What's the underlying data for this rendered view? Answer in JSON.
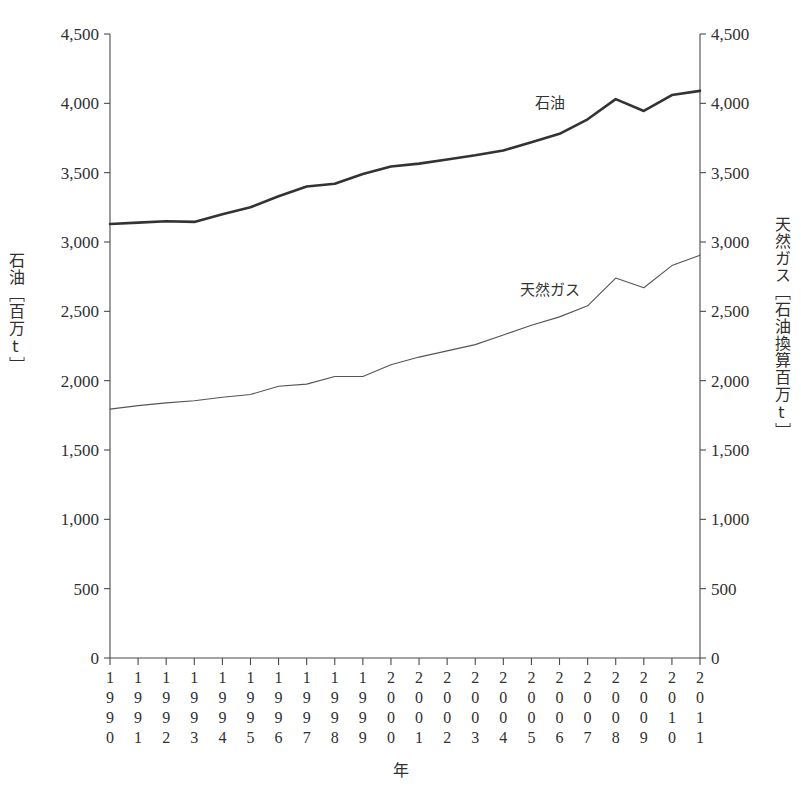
{
  "chart_data": {
    "type": "line",
    "title": "",
    "xlabel": "年",
    "ylabel_left": "石油［百万t］",
    "ylabel_right": "天然ガス［石油換算百万t］",
    "categories": [
      "1990",
      "1991",
      "1992",
      "1993",
      "1994",
      "1995",
      "1996",
      "1997",
      "1998",
      "1999",
      "2000",
      "2001",
      "2002",
      "2003",
      "2004",
      "2005",
      "2006",
      "2007",
      "2008",
      "2009",
      "2010",
      "2011"
    ],
    "ylim_left": [
      0,
      4500
    ],
    "ylim_right": [
      0,
      4500
    ],
    "yticks_left": [
      "0",
      "500",
      "1,000",
      "1,500",
      "2,000",
      "2,500",
      "3,000",
      "3,500",
      "4,000",
      "4,500"
    ],
    "yticks_right": [
      "0",
      "500",
      "1,000",
      "1,500",
      "2,000",
      "2,500",
      "3,000",
      "3,500",
      "4,000",
      "4,500"
    ],
    "ytick_values": [
      0,
      500,
      1000,
      1500,
      2000,
      2500,
      3000,
      3500,
      4000,
      4500
    ],
    "grid": false,
    "legend_position": "inline-annotation",
    "series": [
      {
        "name": "石油",
        "unit": "百万t",
        "label_x_year": "2006",
        "values": [
          3130,
          3140,
          3150,
          3145,
          3200,
          3250,
          3330,
          3400,
          3420,
          3490,
          3545,
          3565,
          3595,
          3625,
          3660,
          3720,
          3780,
          3885,
          4030,
          3945,
          4060,
          4090
        ]
      },
      {
        "name": "天然ガス",
        "unit": "石油換算百万t",
        "label_x_year": "2006",
        "values": [
          1795,
          1820,
          1840,
          1855,
          1880,
          1900,
          1960,
          1975,
          2030,
          2030,
          2115,
          2170,
          2215,
          2260,
          2330,
          2400,
          2460,
          2540,
          2740,
          2670,
          2830,
          2905
        ]
      }
    ]
  },
  "axes": {
    "left_title_chars": [
      "石",
      "油",
      "［",
      "百",
      "万",
      "t",
      "］"
    ],
    "right_title_chars": [
      "天",
      "然",
      "ガ",
      "ス",
      "［",
      "石",
      "油",
      "換",
      "算",
      "百",
      "万",
      "t",
      "］"
    ],
    "x_axis_caption": "年"
  }
}
